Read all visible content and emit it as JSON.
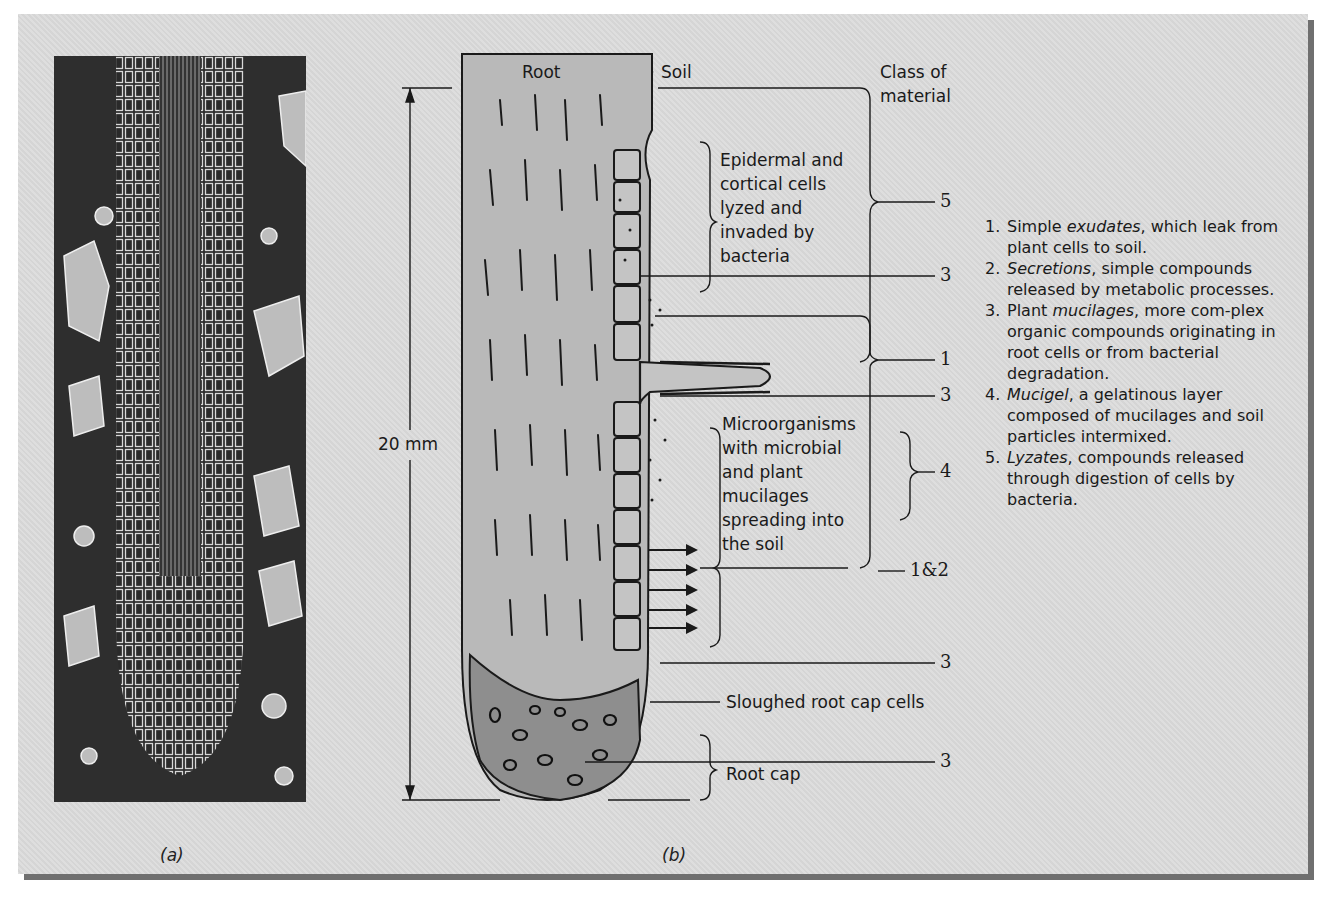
{
  "figure": {
    "panel_a": {
      "caption": "(a)",
      "description": "photomicrograph of root tip in soil"
    },
    "panel_b": {
      "caption": "(b)"
    },
    "labels": {
      "root": "Root",
      "soil": "Soil",
      "class_of_material_line1": "Class of",
      "class_of_material_line2": "material",
      "scale": "20 mm",
      "epidermal": [
        "Epidermal and",
        "cortical cells",
        "lyzed and",
        "invaded by",
        "bacteria"
      ],
      "microorganisms": [
        "Microorganisms",
        "with microbial",
        "and plant",
        "mucilages",
        "spreading into",
        "the soil"
      ],
      "sloughed": "Sloughed root cap cells",
      "root_cap": "Root cap"
    },
    "class_numbers": [
      "5",
      "3",
      "1",
      "3",
      "4",
      "1&2",
      "3",
      "3"
    ],
    "legend": [
      {
        "n": "1.",
        "pre": "Simple ",
        "term": "exudates",
        "post": ", which leak from plant cells to soil."
      },
      {
        "n": "2.",
        "pre": "",
        "term": "Secretions",
        "post": ", simple compounds released by metabolic processes."
      },
      {
        "n": "3.",
        "pre": "Plant ",
        "term": "mucilages",
        "post": ", more com-plex organic compounds originating in root cells or from bacterial degradation."
      },
      {
        "n": "4.",
        "pre": "",
        "term": "Mucigel",
        "post": ", a gelatinous layer composed of mucilages and soil particles intermixed."
      },
      {
        "n": "5.",
        "pre": "",
        "term": "Lyzates",
        "post": ", compounds released through digestion of cells by bacteria."
      }
    ],
    "colors": {
      "panel_bg": "#dcdcdc",
      "root_fill": "#b9b9b9",
      "cap_fill": "#8e8e8e",
      "shadow": "#6f6f6f",
      "ink": "#1a1a1a"
    }
  }
}
